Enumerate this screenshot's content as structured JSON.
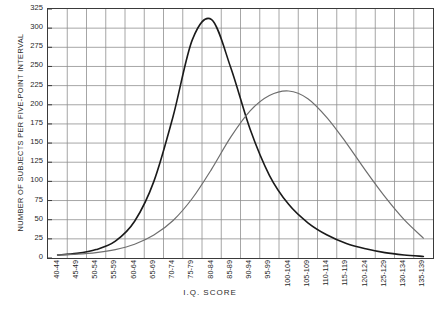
{
  "chart_data": {
    "type": "line",
    "title": "",
    "xlabel": "I.Q. SCORE",
    "ylabel": "NUMBER OF SUBJECTS PER FIVE-POINT INTERVAL",
    "grid": true,
    "legend_position": "none",
    "ylim": [
      0,
      325
    ],
    "ytick_step": 25,
    "yticks": [
      0,
      25,
      50,
      75,
      100,
      125,
      150,
      175,
      200,
      225,
      250,
      275,
      300,
      325
    ],
    "categories": [
      "40-44",
      "45-49",
      "50-54",
      "55-59",
      "60-64",
      "65-69",
      "70-74",
      "75-79",
      "80-84",
      "85-89",
      "90-94",
      "95-99",
      "100-104",
      "105-109",
      "110-114",
      "115-119",
      "120-124",
      "125-129",
      "130-134",
      "135-139"
    ],
    "series": [
      {
        "name": "Curve A",
        "color": "#1a1a1a",
        "peak_category": "75-79",
        "peak_value": 311,
        "values": [
          4,
          6,
          11,
          22,
          48,
          100,
          185,
          285,
          311,
          248,
          168,
          108,
          70,
          46,
          30,
          19,
          12,
          7,
          4,
          2
        ]
      },
      {
        "name": "Curve B",
        "color": "#6e6e6e",
        "peak_category": "100-104",
        "peak_value": 218,
        "values": [
          4,
          5,
          7,
          11,
          18,
          30,
          49,
          78,
          116,
          158,
          192,
          212,
          218,
          208,
          183,
          150,
          114,
          80,
          50,
          26
        ]
      }
    ]
  },
  "axes": {
    "y_title": "NUMBER OF SUBJECTS PER FIVE-POINT INTERVAL",
    "x_title": "I.Q. SCORE"
  },
  "caption": {
    "text": ""
  }
}
